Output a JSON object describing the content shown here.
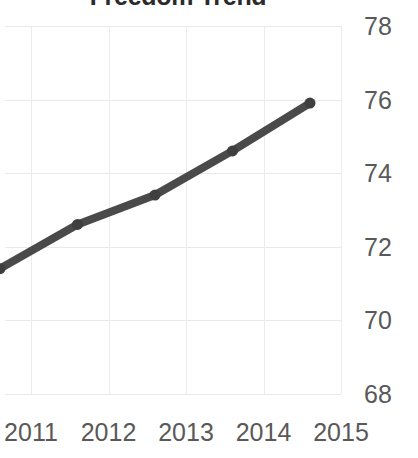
{
  "chart_data": {
    "type": "line",
    "title": "Freedom Trend",
    "xlabel": "",
    "ylabel": "",
    "categories": [
      "2011",
      "2012",
      "2013",
      "2014",
      "2015"
    ],
    "values": [
      70.7,
      71.9,
      72.7,
      73.9,
      75.2
    ],
    "series": [
      {
        "name": "Freedom Score",
        "values": [
          70.7,
          71.9,
          72.7,
          73.9,
          75.2
        ]
      }
    ],
    "x": [
      2011,
      2012,
      2013,
      2014,
      2015
    ],
    "ylim": [
      67.3,
      78.0
    ],
    "yticks": [
      "78",
      "76",
      "74",
      "72",
      "70",
      "68"
    ],
    "ytick_values": [
      78,
      76,
      74,
      72,
      70,
      68
    ],
    "xticks": [
      "2011",
      "2012",
      "2013",
      "2014",
      "2015"
    ],
    "grid": true,
    "legend": "none",
    "y_axis_position": "right",
    "marker": "circle",
    "colors": {
      "line": "#4a4a4a",
      "marker": "#3f3f3f",
      "gridline": "#e9e9e9",
      "tick_label": "#595959",
      "title": "#2b2b2b",
      "background": "#ffffff"
    }
  }
}
